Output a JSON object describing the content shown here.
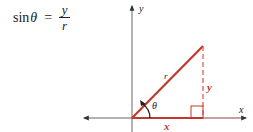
{
  "formula": {
    "function": "sin",
    "variable": "θ",
    "equals": "=",
    "numerator": "y",
    "denominator": "r"
  },
  "diagram": {
    "axis_labels": {
      "x": "x",
      "y": "y"
    },
    "side_labels": {
      "hypotenuse": "r",
      "opposite": "y",
      "adjacent": "x"
    },
    "angle_label": "θ",
    "colors": {
      "axes": "#555555",
      "triangle": "#c0392b",
      "dashed_side": "#d9534f",
      "text": "#222222"
    }
  }
}
